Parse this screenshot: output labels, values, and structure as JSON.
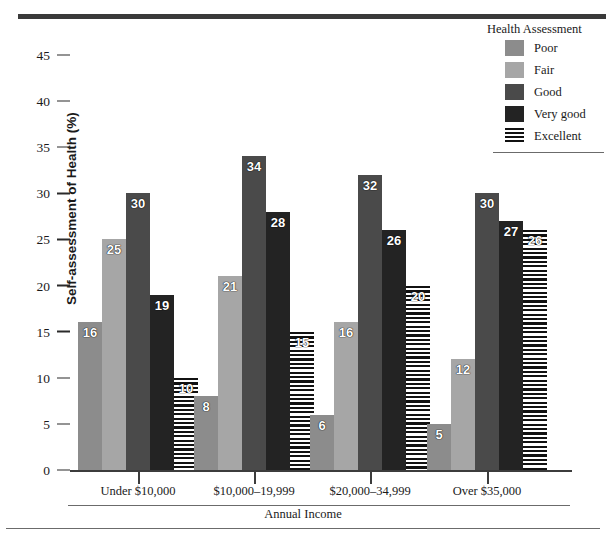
{
  "legend": {
    "title": "Health Assessment",
    "items": [
      {
        "label": "Poor",
        "swatch": "solid-gray-medium",
        "color": "#8c8c8c"
      },
      {
        "label": "Fair",
        "swatch": "solid-gray-light",
        "color": "#a6a6a6"
      },
      {
        "label": "Good",
        "swatch": "solid-gray-dark",
        "color": "#4a4a4a"
      },
      {
        "label": "Very good",
        "swatch": "solid-near-black",
        "color": "#232323"
      },
      {
        "label": "Excellent",
        "swatch": "horizontal-stripes",
        "color": "#111111"
      }
    ]
  },
  "axes": {
    "y_title": "Self-assessment of Health (%)",
    "x_title": "Annual Income",
    "y_ticks": [
      "0",
      "5",
      "10",
      "15",
      "20",
      "25",
      "30",
      "35",
      "40",
      "45"
    ]
  },
  "chart_data": {
    "type": "bar",
    "title": "",
    "xlabel": "Annual Income",
    "ylabel": "Self-assessment of Health (%)",
    "ylim": [
      0,
      45
    ],
    "yticks": [
      0,
      5,
      10,
      15,
      20,
      25,
      30,
      35,
      40,
      45
    ],
    "grid": false,
    "legend_position": "top-right",
    "legend_title": "Health Assessment",
    "categories": [
      "Under $10,000",
      "$10,000–19,999",
      "$20,000–34,999",
      "Over $35,000"
    ],
    "series": [
      {
        "name": "Poor",
        "color": "#8c8c8c",
        "values": [
          16,
          8,
          6,
          5
        ]
      },
      {
        "name": "Fair",
        "color": "#a6a6a6",
        "values": [
          25,
          21,
          16,
          12
        ]
      },
      {
        "name": "Good",
        "color": "#4a4a4a",
        "values": [
          30,
          34,
          32,
          30
        ]
      },
      {
        "name": "Very good",
        "color": "#232323",
        "values": [
          19,
          28,
          26,
          27
        ]
      },
      {
        "name": "Excellent",
        "color": "#111111",
        "values": [
          10,
          15,
          20,
          26
        ]
      }
    ]
  }
}
